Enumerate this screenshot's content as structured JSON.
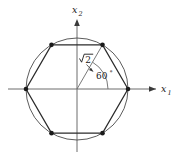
{
  "figure": {
    "background_color": "#ffffff",
    "geometry": {
      "center_x": 77,
      "center_y": 89,
      "circumradius_px": 51,
      "vertex_count": 6,
      "vertex_angles_deg": [
        0,
        60,
        120,
        180,
        240,
        300
      ]
    },
    "axes": {
      "horizontal": {
        "name": "x1",
        "label_base": "x",
        "label_sub": "1",
        "arrow": "right-arrowhead"
      },
      "vertical": {
        "name": "x2",
        "label_base": "x",
        "label_sub": "2",
        "arrow": "up-arrowhead"
      }
    },
    "annotations": {
      "radius_label": {
        "text": "2",
        "symbol": "square-root",
        "full_text": "√2",
        "meaning": "circumradius length"
      },
      "angle_label": {
        "value": "60",
        "unit": "°",
        "full_text": "60°",
        "measured_from": "positive-x1-axis"
      }
    },
    "colors": {
      "hexagon_stroke": "#2b2b2b",
      "circle_stroke": "#4a4a4a",
      "axis_stroke": "#6d6d6d",
      "vertex_dot": "#1a1a1a",
      "annotation": "#3a3a3a"
    }
  }
}
